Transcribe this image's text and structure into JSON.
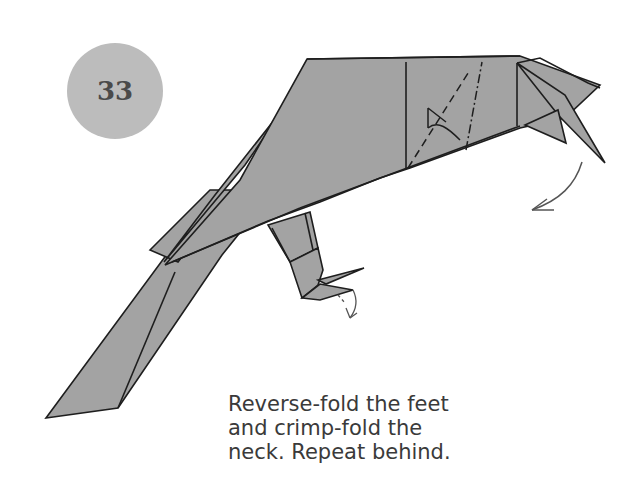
{
  "step": {
    "number": "33"
  },
  "instruction": {
    "lines": [
      "Reverse-fold the feet",
      "and crimp-fold the",
      "neck. Repeat behind."
    ]
  },
  "colors": {
    "paper": "#a3a3a3",
    "paper_light": "#b0b0b0",
    "line": "#1e1e1e",
    "badge": "#bcbcbc",
    "badge_text": "#4a4a4a",
    "arrow": "#555555"
  },
  "diagram": {
    "annotations": [
      "valley-fold dashed line",
      "mountain-fold dash-dot line",
      "crimp arrow on neck",
      "reverse-fold arrow on feet"
    ]
  }
}
